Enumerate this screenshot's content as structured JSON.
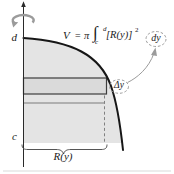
{
  "diagram": {
    "axis_labels": {
      "upper": "d",
      "lower": "c"
    },
    "formula": {
      "v": "V",
      "equals": "=",
      "pi": "π",
      "integral": "∫",
      "upper_limit": "d",
      "lower_limit": "c",
      "integrand": "[R(y)]",
      "exponent": "2",
      "differential": "dy"
    },
    "annotations": {
      "strip_thickness": "Δy",
      "radius": "R(y)"
    },
    "colors": {
      "region_fill": "#e4e4e4",
      "strip_fill": "#dadada",
      "strip_border": "#3d3d3d",
      "curve": "#161616",
      "axis": "#2a2a2a",
      "annotation_gray": "#9b9b9b",
      "brace": "#555555",
      "hairline": "#d9d9d9"
    }
  }
}
